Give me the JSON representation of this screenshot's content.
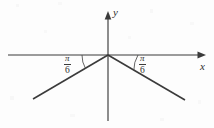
{
  "figure": {
    "background_color": "#fdfdfd",
    "stroke_color": "#3b3b3b",
    "width": 214,
    "height": 128
  },
  "axes": {
    "x_label": "x",
    "y_label": "y",
    "origin": {
      "x": 108,
      "y": 55
    },
    "x_axis": {
      "start_x": 8,
      "end_x": 206,
      "y": 55,
      "arrow": "right"
    },
    "y_axis": {
      "x": 108,
      "top_y": 12,
      "bottom_y": 121,
      "arrow": "up"
    }
  },
  "angles": [
    {
      "id": "left-angle",
      "label_numerator": "π",
      "label_denominator": "6",
      "measure_degrees": 30,
      "side": "left",
      "arc_radius": 26
    },
    {
      "id": "right-angle",
      "label_numerator": "π",
      "label_denominator": "6",
      "measure_degrees": 30,
      "side": "right",
      "arc_radius": 30
    }
  ],
  "rays": [
    {
      "id": "left-ray",
      "from_x": 108,
      "from_y": 55,
      "to_x": 33,
      "to_y": 99
    },
    {
      "id": "right-ray",
      "from_x": 108,
      "from_y": 55,
      "to_x": 185,
      "to_y": 100
    }
  ]
}
